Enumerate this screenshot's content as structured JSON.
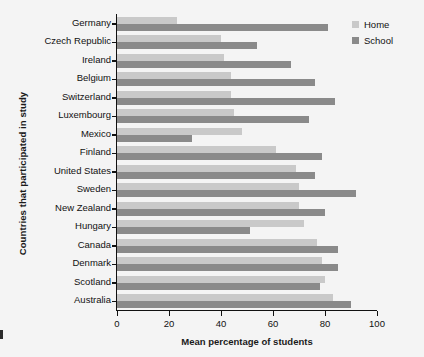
{
  "chart_data": {
    "type": "bar",
    "orientation": "horizontal",
    "title": "",
    "xlabel": "Mean percentage of students",
    "ylabel": "Countries that participated in study",
    "xlim": [
      0,
      100
    ],
    "xticks": [
      0,
      20,
      40,
      60,
      80,
      100
    ],
    "grid": false,
    "legend_position": "top-right",
    "categories": [
      "Germany",
      "Czech Republic",
      "Ireland",
      "Belgium",
      "Switzerland",
      "Luxembourg",
      "Mexico",
      "Finland",
      "United States",
      "Sweden",
      "New Zealand",
      "Hungary",
      "Canada",
      "Denmark",
      "Scotland",
      "Australia"
    ],
    "series": [
      {
        "name": "Home",
        "color": "#c9c9c9",
        "values": [
          23,
          40,
          41,
          44,
          44,
          45,
          48,
          61,
          69,
          70,
          70,
          72,
          77,
          79,
          80,
          83
        ]
      },
      {
        "name": "School",
        "color": "#8a8a8a",
        "values": [
          81,
          54,
          67,
          76,
          84,
          74,
          29,
          79,
          76,
          92,
          80,
          51,
          85,
          85,
          78,
          90
        ]
      }
    ]
  },
  "legend": {
    "items": [
      {
        "label": "Home",
        "color": "#c9c9c9"
      },
      {
        "label": "School",
        "color": "#8a8a8a"
      }
    ]
  },
  "axes": {
    "x_title": "Mean percentage of students",
    "y_title": "Countries that participated in study",
    "x_tick_labels": [
      "0",
      "20",
      "40",
      "60",
      "80",
      "100"
    ]
  }
}
